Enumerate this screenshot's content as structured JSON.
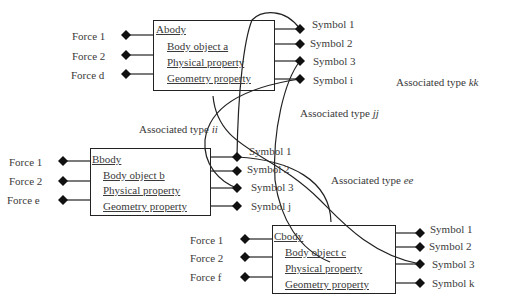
{
  "diagram": {
    "type": "body-symbol association diagram",
    "bodies": [
      {
        "id": "A",
        "title": "Abody",
        "fields": [
          "Body object a",
          "Physical property",
          "Geometry property"
        ],
        "forces": [
          "Force 1",
          "Force 2",
          "Force d"
        ],
        "symbols": [
          "Symbol 1",
          "Symbol 2",
          "Symbol 3",
          "Symbol i"
        ]
      },
      {
        "id": "B",
        "title": "Bbody",
        "fields": [
          "Body object b",
          "Physical property",
          "Geometry property"
        ],
        "forces": [
          "Force 1",
          "Force 2",
          "Force e"
        ],
        "symbols": [
          "Symbol 1",
          "Symbol 2",
          "Symbol 3",
          "Symbol j"
        ]
      },
      {
        "id": "C",
        "title": "Cbody",
        "fields": [
          "Body object c",
          "Physical property",
          "Geometry property"
        ],
        "forces": [
          "Force 1",
          "Force 2",
          "Force f"
        ],
        "symbols": [
          "Symbol 1",
          "Symbol 2",
          "Symbol 3",
          "Symbol k"
        ]
      }
    ],
    "associations": [
      {
        "prefix": "Associated type ",
        "name": "kk"
      },
      {
        "prefix": "Associated type ",
        "name": "jj"
      },
      {
        "prefix": "Associated type ",
        "name": "ii"
      },
      {
        "prefix": "Associated type ",
        "name": "ee"
      }
    ],
    "colors": {
      "line": "#222222",
      "text": "#3a3a3a",
      "background": "#ffffff"
    }
  }
}
